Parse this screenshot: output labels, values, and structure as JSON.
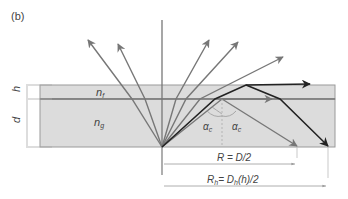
{
  "panel_label": "(b)",
  "labels": {
    "film_thickness": "h",
    "glass_thickness": "d",
    "film_index": "n",
    "film_index_sub": "f",
    "glass_index": "n",
    "glass_index_sub": "g",
    "critical_angle_left": "α",
    "critical_angle_right": "α",
    "critical_angle_sub": "c",
    "radius": "R = D/2",
    "radius_h": "R",
    "radius_h_sub": "h",
    "radius_h_rest_1": "= D",
    "radius_h_rest_sub": "h",
    "radius_h_rest_2": "(h)/2"
  },
  "colors": {
    "slab_fill": "#dcdcdc",
    "slab_border": "#8a8a8a",
    "gray_ray": "#777777",
    "black_ray": "#222222"
  }
}
